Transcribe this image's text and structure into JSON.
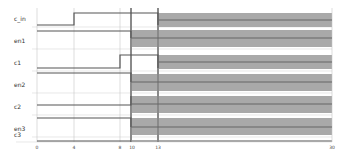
{
  "diagram": {
    "type": "timing",
    "signals": [
      {
        "name": "c_in",
        "y": 18
      },
      {
        "name": "en1",
        "y": 40
      },
      {
        "name": "c1",
        "y": 62
      },
      {
        "name": "en2",
        "y": 85
      },
      {
        "name": "c2",
        "y": 107
      },
      {
        "name": "en3",
        "y": 129
      },
      {
        "name": "c3",
        "y": 151
      }
    ],
    "time_ticks": [
      {
        "label": "0",
        "x": 37
      },
      {
        "label": "4",
        "x": 74
      },
      {
        "label": "8",
        "x": 120
      },
      {
        "label": "10",
        "x": 131
      },
      {
        "label": "13",
        "x": 158
      },
      {
        "label": "30",
        "x": 332
      }
    ],
    "colors": {
      "trace": "#555555",
      "unknown_fill": "#a8a8a8",
      "grid": "#cccccc",
      "marker": "#888888"
    }
  }
}
